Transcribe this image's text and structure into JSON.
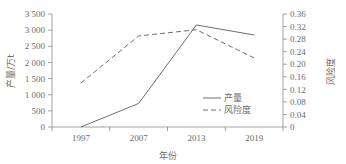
{
  "chart_data": {
    "type": "line",
    "title": "",
    "xlabel": "年份",
    "ylabel": "产量/万t",
    "y2label": "风险度",
    "categories": [
      "1997",
      "2007",
      "2013",
      "2019"
    ],
    "x": [
      1997,
      2007,
      2013,
      2019
    ],
    "ylim": [
      0,
      3500
    ],
    "y2lim": [
      0,
      0.36
    ],
    "grid": false,
    "legend_position": "inside-right-lower",
    "y_ticks": [
      "0",
      "500",
      "1 000",
      "1 500",
      "2 000",
      "2 500",
      "3 000",
      "3 500"
    ],
    "y_tick_values": [
      0,
      500,
      1000,
      1500,
      2000,
      2500,
      3000,
      3500
    ],
    "y2_ticks": [
      "0",
      "0.04",
      "0.08",
      "0.12",
      "0.16",
      "0.20",
      "0.24",
      "0.28",
      "0.32",
      "0.36"
    ],
    "y2_tick_values": [
      0,
      0.04,
      0.08,
      0.12,
      0.16,
      0.2,
      0.24,
      0.28,
      0.32,
      0.36
    ],
    "series": [
      {
        "name": "产量",
        "axis": "left",
        "style": "solid",
        "color": "#6e6e6e",
        "values": [
          0,
          730,
          3160,
          2850
        ]
      },
      {
        "name": "风险度",
        "axis": "right",
        "style": "dashed",
        "color": "#6e6e6e",
        "values": [
          0.14,
          0.29,
          0.31,
          0.22
        ]
      }
    ],
    "legend": [
      {
        "label": "产量",
        "style": "solid"
      },
      {
        "label": "风险度",
        "style": "dashed"
      }
    ]
  }
}
